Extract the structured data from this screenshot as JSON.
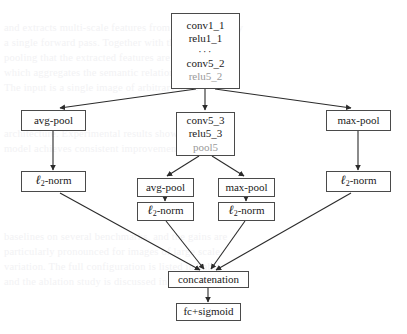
{
  "figure": {
    "type": "neural-network-architecture-flowchart",
    "background_text_lines": [
      "and extracts multi-scale features from these images by",
      "a single forward pass. Together with the adaptive",
      "pooling that the extracted features are stabilized with",
      "which aggregates the semantic relationships from the",
      "The input is a single image of arbitrary size."
    ],
    "background_text_lines_lower": [
      "architecture. Experimental results show that the",
      "model achieves consistent improvements over the",
      "baselines on several benchmarks, and the gains are",
      "particularly pronounced for images of large scale",
      "variation. The full configuration is listed in Table",
      "and the ablation study is discussed in the next"
    ]
  },
  "nodes": {
    "trunk": {
      "id": "trunk-block",
      "lines": [
        "conv1_1",
        "relu1_1",
        "···",
        "conv5_2",
        "relu5_2"
      ],
      "muted_lines": [
        "relu5_2"
      ]
    },
    "center_block": {
      "id": "conv5_3-block",
      "lines": [
        "conv5_3",
        "relu5_3",
        "pool5"
      ],
      "muted_lines": [
        "pool5"
      ]
    },
    "left_pool": {
      "id": "left-avg-pool",
      "label": "avg-pool"
    },
    "right_pool": {
      "id": "right-max-pool",
      "label": "max-pool"
    },
    "left_norm": {
      "id": "left-l2-norm",
      "label": "ℓ",
      "sub": "2",
      "suffix": "-norm"
    },
    "right_norm": {
      "id": "right-l2-norm",
      "label": "ℓ",
      "sub": "2",
      "suffix": "-norm"
    },
    "inner_avg_pool": {
      "id": "inner-avg-pool",
      "label": "avg-pool"
    },
    "inner_max_pool": {
      "id": "inner-max-pool",
      "label": "max-pool"
    },
    "inner_avg_norm": {
      "id": "inner-avg-l2-norm",
      "label": "ℓ",
      "sub": "2",
      "suffix": "-norm"
    },
    "inner_max_norm": {
      "id": "inner-max-l2-norm",
      "label": "ℓ",
      "sub": "2",
      "suffix": "-norm"
    },
    "concatenation": {
      "id": "concatenation",
      "label": "concatenation"
    },
    "output": {
      "id": "fc-sigmoid",
      "label": "fc+sigmoid"
    }
  },
  "style": {
    "box_border_color": "#4a4a4a",
    "text_color": "#1a1a1a",
    "muted_text_color": "#9a9a9a",
    "arrow_color": "#2b2b2b",
    "background_color": "#ffffff"
  },
  "edges": [
    {
      "from": "trunk-block",
      "to": "left-avg-pool"
    },
    {
      "from": "trunk-block",
      "to": "conv5_3-block"
    },
    {
      "from": "trunk-block",
      "to": "right-max-pool"
    },
    {
      "from": "left-avg-pool",
      "to": "left-l2-norm"
    },
    {
      "from": "right-max-pool",
      "to": "right-l2-norm"
    },
    {
      "from": "conv5_3-block",
      "to": "inner-avg-pool"
    },
    {
      "from": "conv5_3-block",
      "to": "inner-max-pool"
    },
    {
      "from": "inner-avg-pool",
      "to": "inner-avg-l2-norm"
    },
    {
      "from": "inner-max-pool",
      "to": "inner-max-l2-norm"
    },
    {
      "from": "left-l2-norm",
      "to": "concatenation"
    },
    {
      "from": "inner-avg-l2-norm",
      "to": "concatenation"
    },
    {
      "from": "inner-max-l2-norm",
      "to": "concatenation"
    },
    {
      "from": "right-l2-norm",
      "to": "concatenation"
    },
    {
      "from": "concatenation",
      "to": "fc-sigmoid"
    }
  ]
}
